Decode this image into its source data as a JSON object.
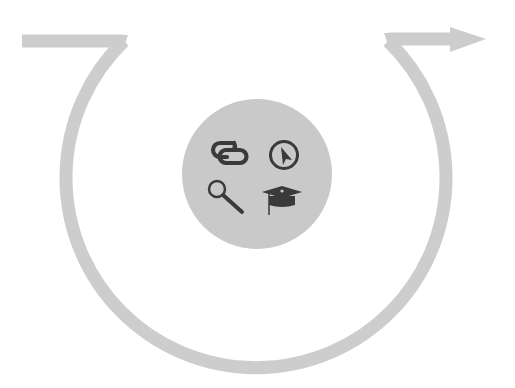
{
  "diagram": {
    "colors": {
      "background": "#ffffff",
      "arc": "#cdcdcd",
      "hub": "#c9c9c9",
      "icon": "#3a3a3a"
    },
    "flow": {
      "start": "left-bar",
      "direction": "clockwise-down-then-up",
      "end": "right-arrow"
    },
    "hub_icons": [
      {
        "name": "link-icon",
        "position": "top-left"
      },
      {
        "name": "cursor-circle-icon",
        "position": "top-right"
      },
      {
        "name": "magnifier-icon",
        "position": "bottom-left"
      },
      {
        "name": "graduation-cap-icon",
        "position": "bottom-right"
      }
    ]
  }
}
